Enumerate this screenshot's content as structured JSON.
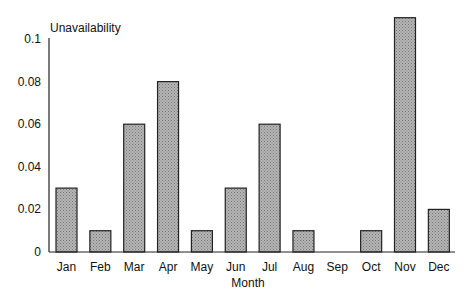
{
  "chart_data": {
    "type": "bar",
    "title": "",
    "ylabel": "Unavailability",
    "xlabel": "Month",
    "categories": [
      "Jan",
      "Feb",
      "Mar",
      "Apr",
      "May",
      "Jun",
      "Jul",
      "Aug",
      "Sep",
      "Oct",
      "Nov",
      "Dec"
    ],
    "values": [
      0.03,
      0.01,
      0.06,
      0.08,
      0.01,
      0.03,
      0.06,
      0.01,
      0,
      0.01,
      0.11,
      0.02
    ],
    "ylim": [
      0,
      0.1
    ],
    "yticks": [
      "0",
      "0.02",
      "0.04",
      "0.06",
      "0.08",
      "0.1"
    ],
    "grid": false,
    "legend": null,
    "bar_fill": "#a8a8a8",
    "bar_stroke": "#222222"
  }
}
